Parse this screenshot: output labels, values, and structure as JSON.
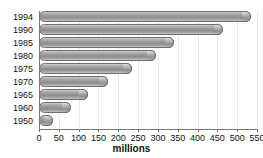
{
  "chart_data": {
    "type": "bar",
    "orientation": "horizontal",
    "title": "",
    "subtitle": "",
    "xlabel": "millions",
    "ylabel": "",
    "categories": [
      "1994",
      "1990",
      "1985",
      "1980",
      "1975",
      "1970",
      "1965",
      "1960",
      "1950"
    ],
    "values": [
      535,
      465,
      340,
      295,
      235,
      175,
      123,
      80,
      35
    ],
    "series": [
      {
        "name": "millions",
        "values": [
          535,
          465,
          340,
          295,
          235,
          175,
          123,
          80,
          35
        ]
      }
    ],
    "xlim": [
      0,
      550
    ],
    "xticks": [
      0,
      50,
      100,
      150,
      200,
      250,
      300,
      350,
      400,
      450,
      500,
      550
    ],
    "xtick_labels": [
      "0",
      "50",
      "100",
      "150",
      "200",
      "250",
      "300",
      "350",
      "400",
      "450",
      "500",
      "550"
    ],
    "grid": "vertical",
    "legend": "none",
    "bar_color": "#9a9a9a",
    "bar_edge_color": "#6f6f6f",
    "gridline_color": "#e8e8e8",
    "axis_color": "#7a7a7a",
    "background_color": "#ffffff",
    "annotations": []
  }
}
